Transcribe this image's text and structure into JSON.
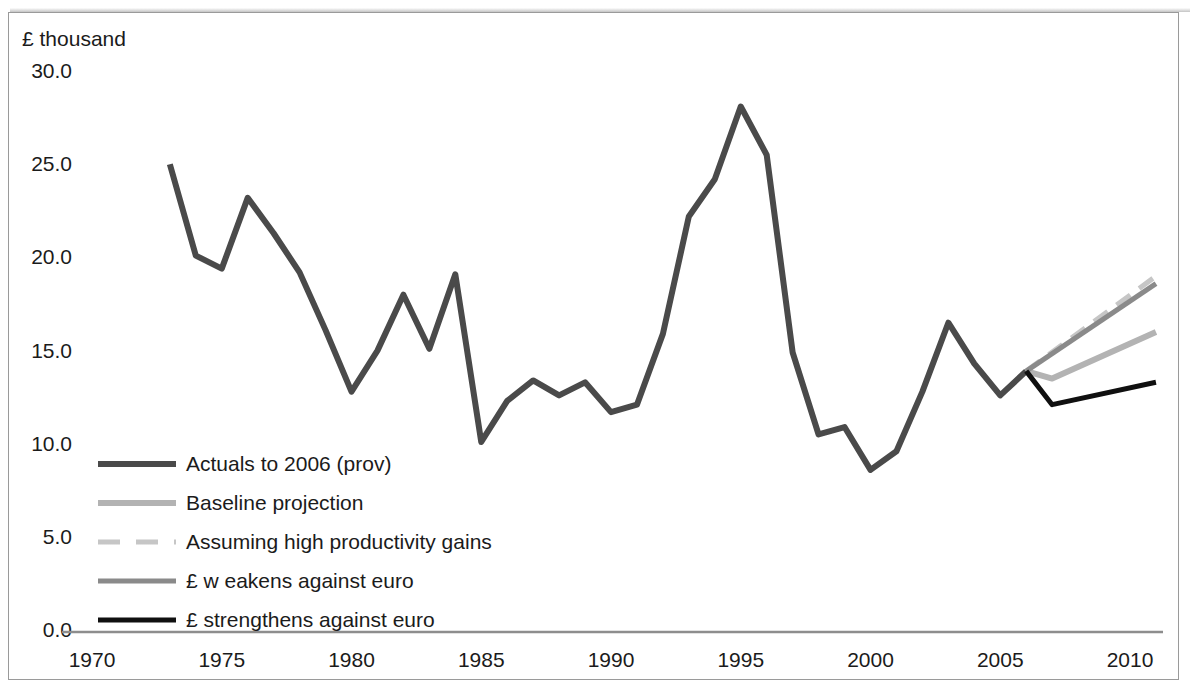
{
  "axis": {
    "y_unit_label": "£ thousand",
    "y_ticks": [
      "30.0",
      "25.0",
      "20.0",
      "15.0",
      "10.0",
      "5.0",
      "0.0"
    ],
    "x_ticks": [
      "1970",
      "1975",
      "1980",
      "1985",
      "1990",
      "1995",
      "2000",
      "2005",
      "2010"
    ]
  },
  "legend": {
    "items": [
      {
        "label": "Actuals to 2006 (prov)",
        "color": "#4a4a4a",
        "style": "solid",
        "width": 6
      },
      {
        "label": "Baseline projection",
        "color": "#b3b3b3",
        "style": "solid",
        "width": 6
      },
      {
        "label": "Assuming high productivity gains",
        "color": "#c6c6c6",
        "style": "dashed",
        "width": 5
      },
      {
        "label": "£ w eakens against euro",
        "color": "#8a8a8a",
        "style": "solid",
        "width": 5
      },
      {
        "label": "£ strengthens against euro",
        "color": "#101010",
        "style": "solid",
        "width": 5
      }
    ]
  },
  "chart_data": {
    "type": "line",
    "title": "",
    "xlabel": "",
    "ylabel": "£ thousand",
    "xlim": [
      1970,
      2011.5
    ],
    "ylim": [
      0.0,
      30.0
    ],
    "ytick_values": [
      30.0,
      25.0,
      20.0,
      15.0,
      10.0,
      5.0,
      0.0
    ],
    "xtick_values": [
      1970,
      1975,
      1980,
      1985,
      1990,
      1995,
      2000,
      2005,
      2010
    ],
    "grid": false,
    "legend_position": "inside-lower-left",
    "series": [
      {
        "name": "Actuals to 2006 (prov)",
        "color": "#4a4a4a",
        "style": "solid",
        "width": 6,
        "x": [
          1973,
          1974,
          1975,
          1976,
          1977,
          1978,
          1979,
          1980,
          1981,
          1982,
          1983,
          1984,
          1985,
          1986,
          1987,
          1988,
          1989,
          1990,
          1991,
          1992,
          1993,
          1994,
          1995,
          1996,
          1997,
          1998,
          1999,
          2000,
          2001,
          2002,
          2003,
          2004,
          2005,
          2006
        ],
        "y": [
          25.1,
          20.2,
          19.5,
          23.3,
          21.4,
          19.3,
          16.2,
          12.9,
          15.1,
          18.1,
          15.2,
          19.2,
          10.2,
          12.4,
          13.5,
          12.7,
          13.4,
          11.8,
          12.2,
          16.0,
          22.3,
          24.3,
          28.2,
          25.6,
          15.0,
          10.6,
          11.0,
          8.7,
          9.7,
          12.9,
          16.6,
          14.4,
          12.7,
          14.0
        ]
      },
      {
        "name": "Baseline projection",
        "color": "#b3b3b3",
        "style": "solid",
        "width": 6,
        "x": [
          2006,
          2007,
          2011
        ],
        "y": [
          14.0,
          13.6,
          16.1
        ]
      },
      {
        "name": "Assuming high productivity gains",
        "color": "#c6c6c6",
        "style": "dashed",
        "width": 5,
        "x": [
          2006,
          2011
        ],
        "y": [
          14.0,
          19.1
        ]
      },
      {
        "name": "£ w eakens against euro",
        "color": "#8a8a8a",
        "style": "solid",
        "width": 5,
        "x": [
          2006,
          2011
        ],
        "y": [
          14.0,
          18.7
        ]
      },
      {
        "name": "£ strengthens against euro",
        "color": "#101010",
        "style": "solid",
        "width": 5,
        "x": [
          2006,
          2007,
          2011
        ],
        "y": [
          14.0,
          12.2,
          13.4
        ]
      }
    ]
  }
}
